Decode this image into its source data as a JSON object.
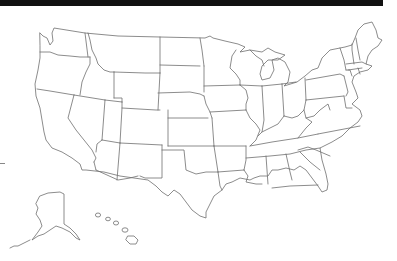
{
  "map": {
    "title": "",
    "subject": "United States state outlines (blank map)",
    "colors": {
      "top_bar": "#111111",
      "outline": "#6f6f6f",
      "background": "#ffffff"
    },
    "regions": [
      "Washington",
      "Oregon",
      "California",
      "Nevada",
      "Idaho",
      "Montana",
      "Wyoming",
      "Utah",
      "Arizona",
      "Colorado",
      "New Mexico",
      "North Dakota",
      "South Dakota",
      "Nebraska",
      "Kansas",
      "Oklahoma",
      "Texas",
      "Minnesota",
      "Iowa",
      "Missouri",
      "Arkansas",
      "Louisiana",
      "Wisconsin",
      "Illinois",
      "Michigan",
      "Indiana",
      "Ohio",
      "Kentucky",
      "Tennessee",
      "Mississippi",
      "Alabama",
      "Georgia",
      "Florida",
      "South Carolina",
      "North Carolina",
      "Virginia",
      "West Virginia",
      "Pennsylvania",
      "New York",
      "Maryland",
      "Delaware",
      "New Jersey",
      "Connecticut",
      "Rhode Island",
      "Massachusetts",
      "Vermont",
      "New Hampshire",
      "Maine",
      "Alaska",
      "Hawaii"
    ]
  }
}
